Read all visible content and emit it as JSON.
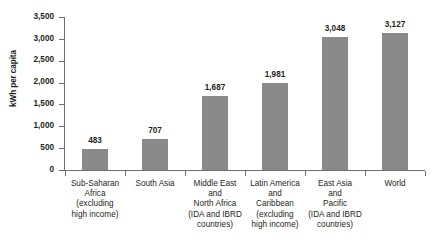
{
  "chart_data": {
    "type": "bar",
    "title": "",
    "subtitle": "",
    "xlabel": "",
    "ylabel": "kWh per capita",
    "ylim": [
      0,
      3500
    ],
    "y_tick_step": 500,
    "grid": false,
    "legend": null,
    "orientation": "vertical",
    "bar_color": "#8a8a8a",
    "axis_color": "#6d6e71",
    "background_color": "#ffffff",
    "categories": [
      "Sub-Saharan Africa (excluding high income)",
      "South Asia",
      "Middle East and North Africa (IDA and IBRD countries)",
      "Latin America and Caribbean (excluding high income)",
      "East Asia and Pacific (IDA and IBRD countries)",
      "World"
    ],
    "category_label_lines": [
      [
        "Sub-Saharan",
        "Africa",
        "(excluding",
        "high income)"
      ],
      [
        "South Asia"
      ],
      [
        "Middle East",
        "and",
        "North Africa",
        "(IDA and IBRD",
        "countries)"
      ],
      [
        "Latin America",
        "and",
        "Caribbean",
        "(excluding",
        "high income)"
      ],
      [
        "East Asia",
        "and",
        "Pacific",
        "(IDA and IBRD",
        "countries)"
      ],
      [
        "World"
      ]
    ],
    "values": [
      483,
      707,
      1687,
      1981,
      3048,
      3127
    ],
    "value_labels": [
      "483",
      "707",
      "1,687",
      "1,981",
      "3,048",
      "3,127"
    ],
    "y_tick_labels": [
      "3,500",
      "3,000",
      "2,500",
      "2,000",
      "1,500",
      "1,000",
      "500",
      "0"
    ],
    "y_tick_values": [
      3500,
      3000,
      2500,
      2000,
      1500,
      1000,
      500,
      0
    ]
  }
}
